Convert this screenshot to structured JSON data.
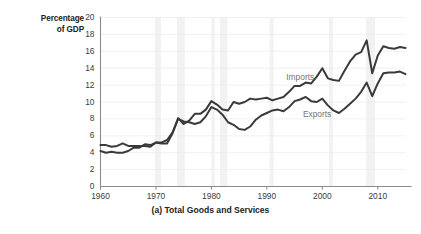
{
  "figure": {
    "caption": "(a) Total Goods and Services",
    "y_axis_title_line1": "Percentage",
    "y_axis_title_line2": "of GDP"
  },
  "colors": {
    "line": "#3a3a3a",
    "axis": "#8a8a8a",
    "grid": "#ececec",
    "band": "#f2f2f2",
    "tick_text": "#3c3c3c",
    "series_label": "#767676",
    "title_text": "#222222",
    "background": "#ffffff"
  },
  "chart_data": {
    "type": "line",
    "title": "(a) Total Goods and Services",
    "xlabel": "",
    "ylabel": "Percentage of GDP",
    "xlim": [
      1960,
      2015
    ],
    "ylim": [
      0,
      20
    ],
    "ytick_labels": [
      "0",
      "2",
      "4",
      "6",
      "8",
      "10",
      "12",
      "14",
      "16",
      "18",
      "20"
    ],
    "yticks": [
      0,
      2,
      4,
      6,
      8,
      10,
      12,
      14,
      16,
      18,
      20
    ],
    "xtick_labels": [
      "1960",
      "1970",
      "1980",
      "1990",
      "2000",
      "2010"
    ],
    "xticks": [
      1960,
      1970,
      1980,
      1990,
      2000,
      2010
    ],
    "grid": "horizontal-faint",
    "legend": "inline-annotations",
    "annotations": [
      {
        "text": "Imports",
        "x": 1993.5,
        "y": 12.9
      },
      {
        "text": "Exports",
        "x": 1996.5,
        "y": 8.6
      }
    ],
    "x": [
      1960,
      1961,
      1962,
      1963,
      1964,
      1965,
      1966,
      1967,
      1968,
      1969,
      1970,
      1971,
      1972,
      1973,
      1974,
      1975,
      1976,
      1977,
      1978,
      1979,
      1980,
      1981,
      1982,
      1983,
      1984,
      1985,
      1986,
      1987,
      1988,
      1989,
      1990,
      1991,
      1992,
      1993,
      1994,
      1995,
      1996,
      1997,
      1998,
      1999,
      2000,
      2001,
      2002,
      2003,
      2004,
      2005,
      2006,
      2007,
      2008,
      2009,
      2010,
      2011,
      2012,
      2013,
      2014,
      2015
    ],
    "series": [
      {
        "name": "Imports",
        "values": [
          4.2,
          4.0,
          4.1,
          4.0,
          4.0,
          4.2,
          4.6,
          4.6,
          5.0,
          4.9,
          5.2,
          5.2,
          5.5,
          6.4,
          8.1,
          7.4,
          7.8,
          8.6,
          8.6,
          9.1,
          10.1,
          9.7,
          9.1,
          9.0,
          10.0,
          9.8,
          10.0,
          10.4,
          10.3,
          10.4,
          10.5,
          10.2,
          10.4,
          10.6,
          11.2,
          11.9,
          11.9,
          12.3,
          12.2,
          13.0,
          14.0,
          12.8,
          12.6,
          12.5,
          13.7,
          14.8,
          15.6,
          15.9,
          17.3,
          13.4,
          15.5,
          16.6,
          16.4,
          16.3,
          16.5,
          16.4
        ]
      },
      {
        "name": "Exports",
        "values": [
          4.9,
          4.9,
          4.7,
          4.8,
          5.1,
          4.8,
          4.8,
          4.8,
          4.8,
          4.7,
          5.2,
          5.1,
          5.1,
          6.3,
          8.0,
          7.7,
          7.6,
          7.4,
          7.6,
          8.3,
          9.4,
          9.1,
          8.5,
          7.6,
          7.3,
          6.8,
          6.7,
          7.1,
          7.9,
          8.4,
          8.7,
          9.0,
          9.1,
          8.9,
          9.4,
          10.1,
          10.3,
          10.6,
          10.1,
          10.0,
          10.4,
          9.6,
          9.0,
          8.7,
          9.2,
          9.8,
          10.4,
          11.2,
          12.3,
          10.7,
          12.2,
          13.4,
          13.5,
          13.5,
          13.6,
          13.3
        ]
      }
    ]
  }
}
